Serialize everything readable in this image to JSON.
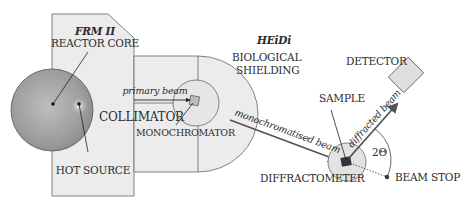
{
  "title": "HEiDi",
  "labels": {
    "facility": "FRM II",
    "reactor_core": "REACTOR CORE",
    "hot_source": "HOT SOURCE",
    "primary_beam": "primary beam",
    "collimator": "COLLIMATOR",
    "monochromator": "MONOCHROMATOR",
    "biological_shielding_1": "BIOLOGICAL",
    "biological_shielding_2": "SHIELDING",
    "monochromatised_beam": "monochromatised beam",
    "sample": "SAMPLE",
    "diffracted_beam": "diffracted beam",
    "detector": "DETECTOR",
    "two_theta": "2Θ",
    "diffractometer": "DIFFRACTOMETER",
    "beam_stop": "BEAM STOP"
  },
  "colors": {
    "shield_fill": "#ececec",
    "outline": "#555555",
    "core_fill": "#9a9a9a",
    "detector_fill": "#dedede",
    "beam": "#555555"
  }
}
